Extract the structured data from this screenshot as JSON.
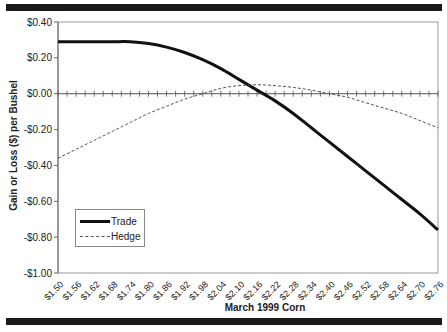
{
  "chart_data": {
    "type": "line",
    "title": "",
    "xlabel": "March 1999 Corn",
    "ylabel": "Gain or Loss ($) per Bushel",
    "ylim": [
      -1.0,
      0.4
    ],
    "yticks": [
      "$0.40",
      "$0.20",
      "$0.00",
      "-$0.20",
      "-$0.40",
      "-$0.60",
      "-$0.80",
      "-$1.00"
    ],
    "ytick_values": [
      0.4,
      0.2,
      0.0,
      -0.2,
      -0.4,
      -0.6,
      -0.8,
      -1.0
    ],
    "categories": [
      "$1.50",
      "$1.56",
      "$1.62",
      "$1.68",
      "$1.74",
      "$1.80",
      "$1.86",
      "$1.92",
      "$1.98",
      "$2.04",
      "$2.10",
      "$2.16",
      "$2.22",
      "$2.28",
      "$2.34",
      "$2.40",
      "$2.46",
      "$2.52",
      "$2.58",
      "$2.64",
      "$2.70",
      "$2.76"
    ],
    "series": [
      {
        "name": "Trade",
        "style": "solid-thick",
        "values": [
          0.29,
          0.29,
          0.29,
          0.29,
          0.29,
          0.28,
          0.26,
          0.23,
          0.19,
          0.14,
          0.08,
          0.02,
          -0.04,
          -0.11,
          -0.19,
          -0.27,
          -0.35,
          -0.43,
          -0.51,
          -0.59,
          -0.67,
          -0.76
        ]
      },
      {
        "name": "Hedge",
        "style": "dashed",
        "values": [
          -0.36,
          -0.31,
          -0.26,
          -0.21,
          -0.16,
          -0.11,
          -0.07,
          -0.03,
          0.0,
          0.03,
          0.045,
          0.05,
          0.045,
          0.035,
          0.02,
          0.0,
          -0.02,
          -0.05,
          -0.08,
          -0.11,
          -0.15,
          -0.19
        ]
      }
    ],
    "grid": false,
    "legend_position": "lower-left inside plot"
  },
  "legend": {
    "trade_label": "Trade",
    "hedge_label": "Hedge"
  }
}
